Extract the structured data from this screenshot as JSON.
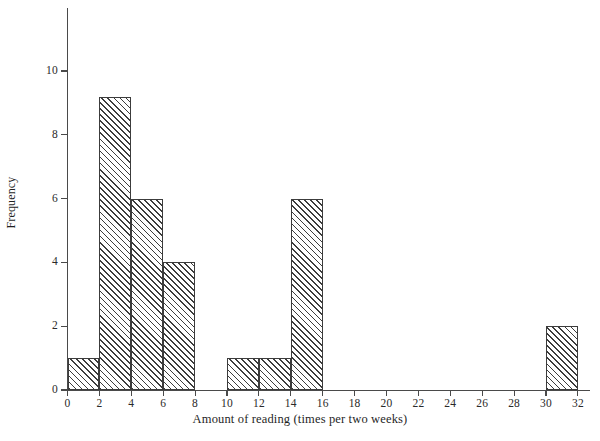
{
  "chart_data": {
    "type": "bar",
    "title": "",
    "subtitle": "",
    "xlabel": "Amount of reading (times per two weeks)",
    "ylabel": "Frequency",
    "bin_width": 2,
    "grid": false,
    "legend": null,
    "xlim": [
      0,
      32
    ],
    "ylim": [
      0,
      11.8
    ],
    "xticks": [
      0,
      2,
      4,
      6,
      8,
      10,
      12,
      14,
      16,
      18,
      20,
      22,
      24,
      26,
      28,
      30,
      32
    ],
    "yticks": [
      0,
      2,
      4,
      6,
      8,
      10
    ],
    "xtick_labels": [
      "0",
      "2",
      "4",
      "6",
      "8",
      "10",
      "12",
      "14",
      "16",
      "18",
      "20",
      "22",
      "24",
      "26",
      "28",
      "30",
      "32"
    ],
    "ytick_labels": [
      "0",
      "2",
      "4",
      "6",
      "8",
      "10"
    ],
    "categories": [
      "0-2",
      "2-4",
      "4-6",
      "6-8",
      "8-10",
      "10-12",
      "12-14",
      "14-16",
      "16-18",
      "18-20",
      "20-22",
      "22-24",
      "24-26",
      "26-28",
      "28-30",
      "30-32"
    ],
    "values": [
      1,
      9.2,
      6,
      4,
      0,
      1,
      1,
      6,
      0,
      0,
      0,
      0,
      0,
      0,
      0,
      2
    ],
    "bins": [
      {
        "start": 0,
        "end": 2,
        "frequency": 1
      },
      {
        "start": 2,
        "end": 4,
        "frequency": 9.2
      },
      {
        "start": 4,
        "end": 6,
        "frequency": 6
      },
      {
        "start": 6,
        "end": 8,
        "frequency": 4
      },
      {
        "start": 8,
        "end": 10,
        "frequency": 0
      },
      {
        "start": 10,
        "end": 12,
        "frequency": 1
      },
      {
        "start": 12,
        "end": 14,
        "frequency": 1
      },
      {
        "start": 14,
        "end": 16,
        "frequency": 6
      },
      {
        "start": 16,
        "end": 18,
        "frequency": 0
      },
      {
        "start": 18,
        "end": 20,
        "frequency": 0
      },
      {
        "start": 20,
        "end": 22,
        "frequency": 0
      },
      {
        "start": 22,
        "end": 24,
        "frequency": 0
      },
      {
        "start": 24,
        "end": 26,
        "frequency": 0
      },
      {
        "start": 26,
        "end": 28,
        "frequency": 0
      },
      {
        "start": 28,
        "end": 30,
        "frequency": 0
      },
      {
        "start": 30,
        "end": 32,
        "frequency": 2
      }
    ],
    "style": {
      "bar_fill": "#ffffff",
      "bar_hatch": "diagonal-45",
      "bar_hatch_color": "#3d3d3d",
      "bar_border_color": "#3c3c3c",
      "axis_color": "#4a4a4a",
      "text_color": "#1f1f1f",
      "background": "#ffffff"
    }
  }
}
